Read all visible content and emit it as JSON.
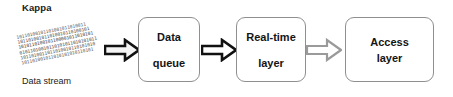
{
  "diagram": {
    "title": "Kappa",
    "type": "flow",
    "orientation": "left-to-right"
  },
  "source": {
    "caption": "Data stream",
    "icon": "binary-data-stream-icon",
    "bit_rows": [
      "10110100101101001011010011",
      "101101001011010010110100101",
      "1010110100101100001011010101",
      "01011010010110101011010101011",
      "1011010011011010010110101010",
      "101101001011010101010110101"
    ]
  },
  "nodes": [
    {
      "id": "data-queue",
      "lines": [
        "Data",
        "queue"
      ],
      "spacing": "spaced"
    },
    {
      "id": "real-time-layer",
      "lines": [
        "Real-time",
        "layer"
      ],
      "spacing": "spaced"
    },
    {
      "id": "access-layer",
      "lines": [
        "Access",
        "layer"
      ],
      "spacing": "tight"
    }
  ],
  "arrows": [
    {
      "id": "arrow-stream-to-queue",
      "from": "data-stream",
      "to": "data-queue",
      "style": "block-arrow-dark",
      "outline": "#111111",
      "fill": "#f2f2f2"
    },
    {
      "id": "arrow-queue-to-realtime",
      "from": "data-queue",
      "to": "real-time-layer",
      "style": "block-arrow-dark",
      "outline": "#111111",
      "fill": "#ffffff"
    },
    {
      "id": "arrow-realtime-to-access",
      "from": "real-time-layer",
      "to": "access-layer",
      "style": "block-arrow-light",
      "outline": "#9a9a9a",
      "fill": "#ffffff"
    }
  ],
  "colors": {
    "node_border": "#8f8f8f",
    "text": "#141414",
    "background": "#ffffff",
    "stream_text": "#3a3a3a"
  }
}
